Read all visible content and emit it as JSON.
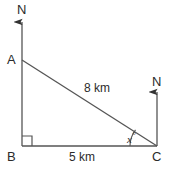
{
  "figure": {
    "type": "right-triangle-bearing-diagram",
    "background_color": "#ffffff",
    "line_color": "#555555",
    "text_color": "#2b2b2b",
    "vertices": {
      "a": {
        "label": "A",
        "x": 22,
        "y": 60
      },
      "b": {
        "label": "B",
        "x": 22,
        "y": 146
      },
      "c": {
        "label": "C",
        "x": 157,
        "y": 146
      }
    },
    "sides": {
      "hypotenuse_label": "8 km",
      "base_label": "5 km",
      "vertical_label": ""
    },
    "angles": {
      "right_angle_at": "B",
      "unknown_angle_label": "x",
      "unknown_angle_unit": "°",
      "unknown_angle_at": "C"
    },
    "north_arrows": [
      {
        "label": "N",
        "at": "A",
        "tip_x": 22,
        "tip_y": 18
      },
      {
        "label": "N",
        "at": "C",
        "tip_x": 157,
        "tip_y": 88
      }
    ]
  }
}
